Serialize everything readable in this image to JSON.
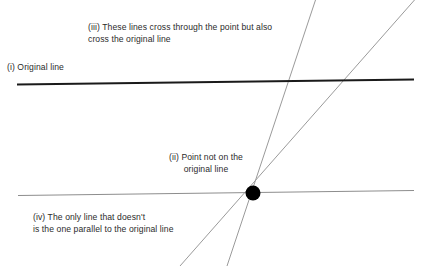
{
  "diagram": {
    "canvas": {
      "width": 424,
      "height": 266,
      "background": "#ffffff"
    },
    "colors": {
      "original_line": "#1a1a1a",
      "parallel_line": "#8d8d8d",
      "crossing_line": "#9a9a9a",
      "point": "#000000",
      "text": "#2b2b2b"
    },
    "labels": {
      "original_line": "(i) Original line",
      "point": "(ii) Point not on the\noriginal line",
      "crossing_lines": "(iii) These lines cross through the point but also\ncross the original line",
      "parallel_note": "(iv) The only line that doesn't\nis the one parallel to the original line"
    },
    "geometry": {
      "point": {
        "x": 253,
        "y": 193,
        "radius": 7.5
      },
      "original_line": {
        "x1": 17,
        "y1": 84.5,
        "x2": 414,
        "y2": 79.5,
        "stroke_width": 1.9
      },
      "parallel_line": {
        "x1": 18,
        "y1": 195.5,
        "x2": 414,
        "y2": 190.5,
        "stroke_width": 1.1
      },
      "crossing_line_steep": {
        "x1": 227,
        "y1": 266,
        "x2": 315.5,
        "y2": 0,
        "stroke_width": 1.0
      },
      "crossing_line_shallow": {
        "x1": 180,
        "y1": 266,
        "x2": 414.5,
        "y2": 0,
        "stroke_width": 1.0
      }
    }
  }
}
